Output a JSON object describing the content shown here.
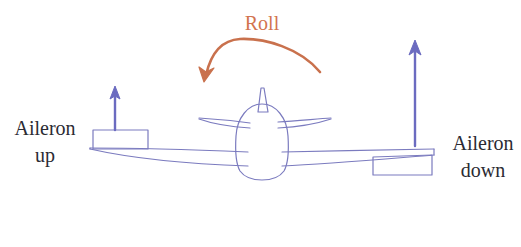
{
  "diagram": {
    "background_color": "#ffffff",
    "aircraft_line_color": "#7b7bbf",
    "arrow_color": "#6b6bc0",
    "roll_color": "#d2744f",
    "label_color": "#2b2b33"
  },
  "labels": {
    "roll": "Roll",
    "left": {
      "line1": "Aileron",
      "line2": "up"
    },
    "right": {
      "line1": "Aileron",
      "line2": "down"
    }
  },
  "icons": {
    "roll_arrow": "curved-roll-arrow-icon",
    "left_arrow": "up-arrow-icon",
    "right_arrow": "up-arrow-icon",
    "aircraft": "aircraft-front-view-icon"
  }
}
